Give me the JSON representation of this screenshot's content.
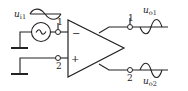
{
  "diagram": {
    "type": "differential-amplifier-circuit",
    "colors": {
      "stroke": "#222222",
      "background": "#ffffff"
    },
    "input": {
      "label": "u",
      "label_sub": "i1",
      "source_icon": "ac-source-icon",
      "waveform": "sine"
    },
    "terminals": {
      "in_1": "1",
      "in_2": "2",
      "out_1": "1",
      "out_2": "2"
    },
    "amplifier": {
      "inverting_sign": "−",
      "noninverting_sign": "+"
    },
    "outputs": [
      {
        "label": "u",
        "label_sub": "o1",
        "waveform": "sine",
        "phase": "inverted"
      },
      {
        "label": "u",
        "label_sub": "o2",
        "waveform": "sine",
        "phase": "in-phase"
      }
    ]
  }
}
